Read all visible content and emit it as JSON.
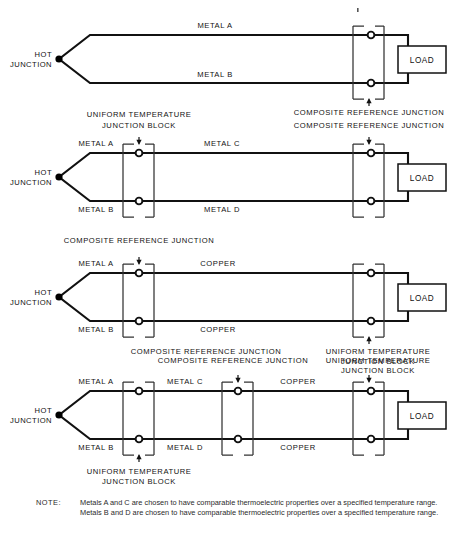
{
  "figure": {
    "stroke_color": "#111111",
    "background_color": "#ffffff"
  },
  "labels": {
    "hot_junction_line1": "HOT",
    "hot_junction_line2": "JUNCTION",
    "load": "LOAD",
    "metal_a": "METAL A",
    "metal_b": "METAL B",
    "metal_c": "METAL C",
    "metal_d": "METAL D",
    "copper": "COPPER",
    "uniform_block_line1": "UNIFORM TEMPERATURE",
    "uniform_block_line2": "JUNCTION BLOCK",
    "composite_reference_junction": "COMPOSITE REFERENCE JUNCTION"
  },
  "diagrams": [
    {
      "id": "diagram-1",
      "index": 1,
      "wire_labels": [
        "METAL A",
        "METAL B"
      ],
      "blocks": [
        {
          "name": "composite-reference-junction",
          "label": "COMPOSITE REFERENCE JUNCTION",
          "label_position": "below"
        }
      ],
      "load": "LOAD",
      "hot_junction": [
        "HOT",
        "JUNCTION"
      ]
    },
    {
      "id": "diagram-2",
      "index": 2,
      "wire_labels": [
        "METAL A",
        "METAL C",
        "METAL B",
        "METAL D"
      ],
      "blocks": [
        {
          "name": "uniform-temperature-junction-block",
          "label": "UNIFORM TEMPERATURE JUNCTION BLOCK",
          "label_position": "above"
        },
        {
          "name": "composite-reference-junction",
          "label": "COMPOSITE REFERENCE JUNCTION",
          "label_position": "above"
        }
      ],
      "load": "LOAD",
      "hot_junction": [
        "HOT",
        "JUNCTION"
      ]
    },
    {
      "id": "diagram-3",
      "index": 3,
      "wire_labels": [
        "METAL A",
        "COPPER",
        "METAL B",
        "COPPER"
      ],
      "blocks": [
        {
          "name": "composite-reference-junction",
          "label": "COMPOSITE REFERENCE JUNCTION",
          "label_position": "above"
        },
        {
          "name": "uniform-temperature-junction-block",
          "label": "UNIFORM TEMPERATURE JUNCTION BLOCK",
          "label_position": "below"
        }
      ],
      "extra_label": "COMPOSITE REFERENCE JUNCTION",
      "load": "LOAD",
      "hot_junction": [
        "HOT",
        "JUNCTION"
      ]
    },
    {
      "id": "diagram-4",
      "index": 4,
      "wire_labels": [
        "METAL A",
        "METAL C",
        "COPPER",
        "METAL B",
        "METAL D",
        "COPPER"
      ],
      "blocks": [
        {
          "name": "uniform-temperature-junction-block",
          "label": "UNIFORM TEMPERATURE JUNCTION BLOCK",
          "label_position": "below"
        },
        {
          "name": "composite-reference-junction",
          "label": "COMPOSITE REFERENCE JUNCTION",
          "label_position": "above"
        },
        {
          "name": "uniform-temperature-junction-block",
          "label": "UNIFORM TEMPERATURE JUNCTION BLOCK",
          "label_position": "above"
        }
      ],
      "load": "LOAD",
      "hot_junction": [
        "HOT",
        "JUNCTION"
      ]
    }
  ],
  "note": {
    "tag": "NOTE:",
    "line1": "Metals A and C are chosen to have comparable thermoelectric properties over a specified temperature range.",
    "line2": "Metals B and D are chosen to have comparable thermoelectric properties over a specified temperature range."
  }
}
